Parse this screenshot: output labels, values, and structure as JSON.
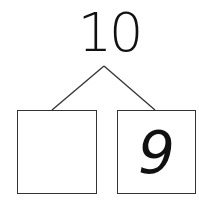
{
  "number_bond": {
    "whole": "10",
    "parts": [
      {
        "value": ""
      },
      {
        "value": "9"
      }
    ]
  }
}
